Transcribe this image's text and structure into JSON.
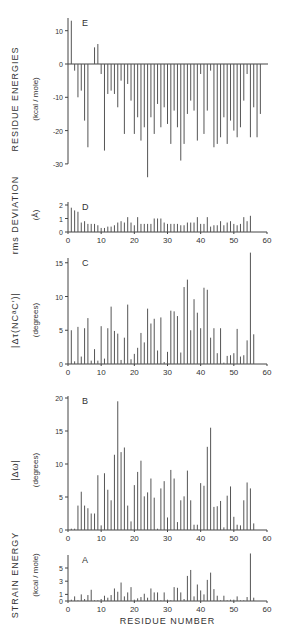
{
  "figure": {
    "x_axis_label": "RESIDUE NUMBER",
    "x_ticks": [
      0,
      10,
      20,
      30,
      40,
      50,
      60
    ]
  },
  "chart_data": [
    {
      "panel": "E",
      "type": "bar",
      "title": "",
      "ylabel": "RESIDUE ENERGIES",
      "yunits": "(kcal / mole)",
      "xlabel": "",
      "ylim": [
        -35,
        13
      ],
      "xlim": [
        0,
        60
      ],
      "y_ticks": [
        10,
        0,
        -10,
        -20,
        -30
      ],
      "x": [
        1,
        2,
        3,
        4,
        5,
        6,
        7,
        8,
        9,
        10,
        11,
        12,
        13,
        14,
        15,
        16,
        17,
        18,
        19,
        20,
        21,
        22,
        23,
        24,
        25,
        26,
        27,
        28,
        29,
        30,
        31,
        32,
        33,
        34,
        35,
        36,
        37,
        38,
        39,
        40,
        41,
        42,
        43,
        44,
        45,
        46,
        47,
        48,
        49,
        50,
        51,
        52,
        53,
        54,
        55,
        56,
        57,
        58
      ],
      "values": [
        13,
        -2,
        -10,
        -8,
        -17,
        -25,
        0,
        5,
        6,
        -3,
        -26,
        -9,
        -8,
        -9,
        -13,
        -5,
        -21,
        -6,
        -11,
        -21,
        -16,
        -23,
        -19,
        -34,
        -16,
        -21,
        -12,
        -19,
        -13,
        -18,
        -24,
        -14,
        -19,
        -29,
        -24,
        -15,
        -11,
        -14,
        -23,
        -3,
        -21,
        -14,
        -2,
        -25,
        -24,
        -22,
        -16,
        -24,
        -17,
        -20,
        -22,
        -19,
        -11,
        -3,
        -22,
        -13,
        -22,
        -15
      ]
    },
    {
      "panel": "D",
      "type": "bar",
      "ylabel": "rms DEVIATION",
      "yunits": "(Å)",
      "ylim": [
        0,
        2
      ],
      "xlim": [
        0,
        60
      ],
      "y_ticks": [
        0,
        1,
        2
      ],
      "x_ticks": [
        0,
        10,
        20,
        30,
        40,
        50,
        60
      ],
      "x": [
        1,
        2,
        3,
        4,
        5,
        6,
        7,
        8,
        9,
        10,
        11,
        12,
        13,
        14,
        15,
        16,
        17,
        18,
        19,
        20,
        21,
        22,
        23,
        24,
        25,
        26,
        27,
        28,
        29,
        30,
        31,
        32,
        33,
        34,
        35,
        36,
        37,
        38,
        39,
        40,
        41,
        42,
        43,
        44,
        45,
        46,
        47,
        48,
        49,
        50,
        51,
        52,
        53,
        54,
        55
      ],
      "values": [
        1.8,
        1.6,
        1.5,
        0.7,
        0.8,
        0.6,
        0.6,
        0.6,
        0.5,
        0.3,
        0.3,
        0.4,
        0.4,
        0.5,
        0.7,
        0.8,
        0.7,
        1.1,
        0.7,
        0.5,
        1.1,
        0.6,
        0.6,
        0.6,
        0.6,
        1.0,
        1.0,
        1.0,
        0.7,
        0.6,
        0.6,
        0.6,
        0.6,
        0.5,
        0.5,
        0.7,
        0.7,
        0.7,
        1.1,
        0.6,
        0.6,
        1.1,
        0.4,
        0.5,
        0.5,
        0.8,
        0.5,
        0.7,
        0.8,
        0.6,
        0.5,
        0.6,
        1.1,
        0.8,
        1.2
      ]
    },
    {
      "panel": "C",
      "type": "bar",
      "ylabel": "|Δτ(NCᵃC′)|",
      "yunits": "(degrees)",
      "ylim": [
        0,
        16
      ],
      "xlim": [
        0,
        60
      ],
      "y_ticks": [
        0,
        5,
        10,
        15
      ],
      "x_ticks": [
        0,
        10,
        20,
        30,
        40,
        50,
        60
      ],
      "x": [
        1,
        2,
        3,
        4,
        5,
        6,
        7,
        8,
        9,
        10,
        11,
        12,
        13,
        14,
        15,
        16,
        17,
        18,
        19,
        20,
        21,
        22,
        23,
        24,
        25,
        26,
        27,
        28,
        29,
        30,
        31,
        32,
        33,
        34,
        35,
        36,
        37,
        38,
        39,
        40,
        41,
        42,
        43,
        44,
        45,
        46,
        47,
        48,
        49,
        50,
        51,
        52,
        53,
        54,
        55,
        56
      ],
      "values": [
        5.0,
        0.4,
        5.5,
        1.1,
        5.3,
        6.8,
        0.5,
        2.2,
        0.5,
        5.6,
        0.8,
        5.3,
        8.5,
        4.9,
        4.5,
        0.6,
        3.9,
        8.8,
        0.7,
        1.5,
        2.4,
        4.6,
        3.2,
        8.2,
        6.0,
        6.7,
        2.0,
        6.9,
        0.3,
        1.8,
        7.9,
        7.8,
        7.1,
        1.7,
        11.4,
        12.5,
        5.0,
        9.6,
        7.6,
        5.3,
        11.3,
        11.0,
        3.9,
        5.3,
        1.6,
        5.3,
        0.2,
        1.2,
        1.3,
        1.6,
        5.2,
        1.1,
        1.3,
        3.5,
        16.5,
        4.4
      ]
    },
    {
      "panel": "B",
      "type": "bar",
      "ylabel": "|Δω|",
      "yunits": "(degrees)",
      "ylim": [
        0,
        20
      ],
      "xlim": [
        0,
        60
      ],
      "y_ticks": [
        0,
        5,
        10,
        15,
        20
      ],
      "x_ticks": [
        0,
        10,
        20,
        30,
        40,
        50,
        60
      ],
      "x": [
        1,
        2,
        3,
        4,
        5,
        6,
        7,
        8,
        9,
        10,
        11,
        12,
        13,
        14,
        15,
        16,
        17,
        18,
        19,
        20,
        21,
        22,
        23,
        24,
        25,
        26,
        27,
        28,
        29,
        30,
        31,
        32,
        33,
        34,
        35,
        36,
        37,
        38,
        39,
        40,
        41,
        42,
        43,
        44,
        45,
        46,
        47,
        48,
        49,
        50,
        51,
        52,
        53,
        54,
        55,
        56
      ],
      "values": [
        0.2,
        0.2,
        3.7,
        5.8,
        3.7,
        3.3,
        2.5,
        2.5,
        8.3,
        0.7,
        8.6,
        6.1,
        4.5,
        11.4,
        19.5,
        11.8,
        12.5,
        3.7,
        1.3,
        6.8,
        8.8,
        10.5,
        5.1,
        5.7,
        7.8,
        4.9,
        0.2,
        6.3,
        7.4,
        1.9,
        9.1,
        7.8,
        1.2,
        4.5,
        5.1,
        9.0,
        4.5,
        0.8,
        0.8,
        7.1,
        6.7,
        12.6,
        15.5,
        3.5,
        3.6,
        4.4,
        0.4,
        5.2,
        6.6,
        2.0,
        0.8,
        0.7,
        4.5,
        7.2,
        6.3,
        1.0
      ]
    },
    {
      "panel": "A",
      "type": "bar",
      "ylabel": "STRAIN ENERGY",
      "yunits": "(kcal / mole)",
      "ylim": [
        0,
        7
      ],
      "xlim": [
        0,
        60
      ],
      "y_ticks": [
        0,
        1,
        3,
        5
      ],
      "x_ticks": [
        0,
        10,
        20,
        30,
        40,
        50,
        60
      ],
      "x": [
        1,
        2,
        3,
        4,
        5,
        6,
        7,
        8,
        9,
        10,
        11,
        12,
        13,
        14,
        15,
        16,
        17,
        18,
        19,
        20,
        21,
        22,
        23,
        24,
        25,
        26,
        27,
        28,
        29,
        30,
        31,
        32,
        33,
        34,
        35,
        36,
        37,
        38,
        39,
        40,
        41,
        42,
        43,
        44,
        45,
        46,
        47,
        48,
        49,
        50,
        51,
        52,
        53,
        54,
        55,
        56
      ],
      "values": [
        0.2,
        0.7,
        0.1,
        1.0,
        0.3,
        0.9,
        1.7,
        0.1,
        0.1,
        0.3,
        0.8,
        0.5,
        0.9,
        1.9,
        1.4,
        2.8,
        0.7,
        1.3,
        2.1,
        0.2,
        0.4,
        0.6,
        1.1,
        0.5,
        1.9,
        1.3,
        1.3,
        0.1,
        1.3,
        0.2,
        0.1,
        2.1,
        2.0,
        1.3,
        0.3,
        3.8,
        4.7,
        0.7,
        2.5,
        1.6,
        1.0,
        3.2,
        4.3,
        1.8,
        0.8,
        0.1,
        0.8,
        0.1,
        0.2,
        0.2,
        0.7,
        0.1,
        0.1,
        0.6,
        7.2,
        0.5
      ],
      "xlabel": "RESIDUE NUMBER"
    }
  ]
}
